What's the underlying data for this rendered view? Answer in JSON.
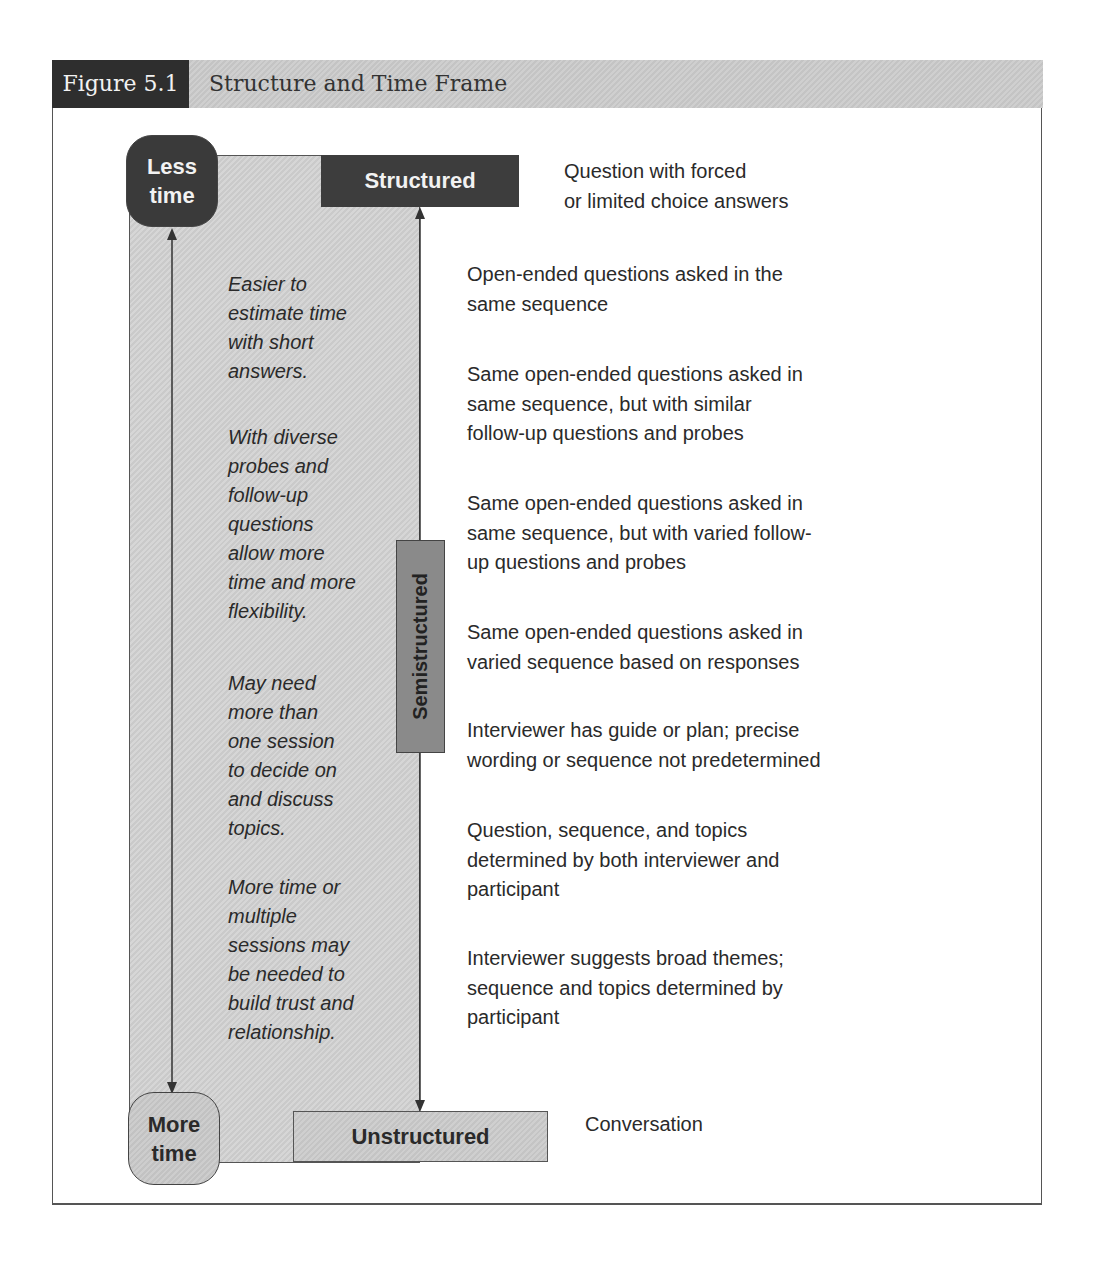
{
  "figure": {
    "label": "Figure 5.1",
    "title": "Structure and Time Frame"
  },
  "time_axis": {
    "top": "Less time",
    "top_lines": [
      "Less",
      "time"
    ],
    "bottom": "More time",
    "bottom_lines": [
      "More",
      "time"
    ]
  },
  "structure_axis": {
    "top": "Structured",
    "middle": "Semistructured",
    "bottom": "Unstructured"
  },
  "left_notes": [
    {
      "lines": [
        "Easier to",
        "estimate time",
        "with short",
        "answers."
      ]
    },
    {
      "lines": [
        "With diverse",
        "probes and",
        "follow-up",
        "questions",
        "allow more",
        "time and more",
        "flexibility."
      ]
    },
    {
      "lines": [
        "May need",
        "more than",
        "one session",
        "to decide on",
        "and discuss",
        "topics."
      ]
    },
    {
      "lines": [
        "More time or",
        "multiple",
        "sessions may",
        "be needed to",
        "build trust and",
        "relationship."
      ]
    }
  ],
  "descriptions": {
    "structured": [
      "Question with forced",
      "or limited choice answers"
    ],
    "items": [
      {
        "lines": [
          "Open-ended questions asked in the",
          "same sequence"
        ]
      },
      {
        "lines": [
          "Same open-ended questions asked in",
          "same sequence, but with similar",
          "follow-up questions and probes"
        ]
      },
      {
        "lines": [
          "Same open-ended questions asked in",
          "same sequence, but with varied follow-",
          "up questions and probes"
        ]
      },
      {
        "lines": [
          "Same open-ended questions asked in",
          "varied sequence based on responses"
        ]
      },
      {
        "lines": [
          "Interviewer has guide or plan; precise",
          "wording or sequence not predetermined"
        ]
      },
      {
        "lines": [
          "Question, sequence, and topics",
          "determined by both interviewer and",
          "participant"
        ]
      },
      {
        "lines": [
          "Interviewer suggests broad themes;",
          "sequence and topics determined by",
          "participant"
        ]
      }
    ],
    "unstructured": "Conversation"
  },
  "colors": {
    "dark_fill": "#3a3a3a",
    "mid_fill": "#8a8a8a",
    "light_fill": "#cfcfcf",
    "text": "#2a2a2a"
  }
}
